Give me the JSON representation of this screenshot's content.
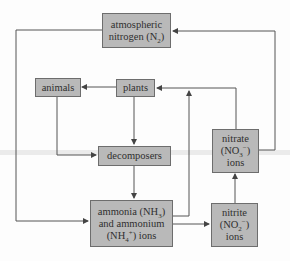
{
  "diagram": {
    "nodes": {
      "atmospheric": {
        "line1": "atmospheric",
        "line2_pre": "nitrogen (N",
        "line2_sub": "2",
        "line2_post": ")"
      },
      "animals": {
        "label": "animals"
      },
      "plants": {
        "label": "plants"
      },
      "decomposers": {
        "label": "decomposers"
      },
      "ammonia": {
        "line1_pre": "ammonia (NH",
        "line1_sub": "3",
        "line1_post": ")",
        "line2": "and ammonium",
        "line3_pre": "(NH",
        "line3_sub": "4",
        "line3_sup": "+",
        "line3_post": ") ions"
      },
      "nitrite": {
        "line1": "nitrite",
        "line2_pre": "(NO",
        "line2_sub": "2",
        "line2_sup": "−",
        "line2_post": ")",
        "line3": "ions"
      },
      "nitrate": {
        "line1": "nitrate",
        "line2_pre": "(NO",
        "line2_sub": "3",
        "line2_sup": "−",
        "line2_post": ")",
        "line3": "ions"
      }
    },
    "edges": [
      {
        "from": "atmospheric nitrogen",
        "to": "ammonia and ammonium ions"
      },
      {
        "from": "plants",
        "to": "animals"
      },
      {
        "from": "plants",
        "to": "decomposers"
      },
      {
        "from": "animals",
        "to": "decomposers"
      },
      {
        "from": "decomposers",
        "to": "ammonia and ammonium ions"
      },
      {
        "from": "ammonia and ammonium ions",
        "to": "plants"
      },
      {
        "from": "ammonia and ammonium ions",
        "to": "nitrite ions"
      },
      {
        "from": "nitrite ions",
        "to": "nitrate ions"
      },
      {
        "from": "nitrate ions",
        "to": "plants"
      },
      {
        "from": "nitrate ions",
        "to": "atmospheric nitrogen"
      }
    ],
    "colors": {
      "box_fill": "#b9b9b9",
      "box_border": "#6d6d6d",
      "line": "#555555",
      "text": "#2f2f2f"
    }
  }
}
